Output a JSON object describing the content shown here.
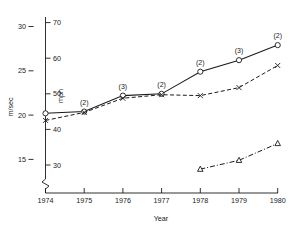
{
  "chart_data": {
    "type": "line",
    "title": "",
    "xlabel": "Year",
    "ylabel": "m/sec",
    "ylabel_secondary": "mph",
    "grid": false,
    "legend": "none",
    "axis_break": true,
    "x": [
      1974,
      1975,
      1976,
      1977,
      1978,
      1979,
      1980
    ],
    "xtick_labels": [
      "1974",
      "1975",
      "1976",
      "1977",
      "1978",
      "1979",
      "1980"
    ],
    "ylim": [
      13,
      30.8
    ],
    "ytick_labels": [
      "30",
      "25",
      "20",
      "15"
    ],
    "ytick_values": [
      30,
      25,
      20,
      15
    ],
    "ylim_secondary": [
      29.1,
      68.9
    ],
    "ytick_labels_secondary": [
      "70",
      "60",
      "50",
      "40",
      "30"
    ],
    "ytick_values_secondary": [
      70,
      60,
      50,
      40,
      30
    ],
    "series": [
      {
        "name": "circle-series",
        "marker": "circle",
        "linestyle": "solid",
        "x": [
          1974,
          1975,
          1976,
          1977,
          1978,
          1979,
          1980
        ],
        "values": [
          20.2,
          20.4,
          22.2,
          22.4,
          24.9,
          26.2,
          27.9
        ],
        "annotations": [
          "",
          "(2)",
          "(3)",
          "(2)",
          "(2)",
          "(3)",
          "(2)"
        ]
      },
      {
        "name": "cross-series",
        "marker": "x",
        "linestyle": "dashed",
        "x": [
          1974,
          1975,
          1976,
          1977,
          1978,
          1979,
          1980
        ],
        "values": [
          19.4,
          20.3,
          21.9,
          22.3,
          22.2,
          23.1,
          25.6
        ],
        "annotations": [
          "",
          "",
          "",
          "",
          "",
          "",
          ""
        ]
      },
      {
        "name": "triangle-series",
        "marker": "triangle",
        "linestyle": "dashdot",
        "x": [
          1978,
          1979,
          1980
        ],
        "values": [
          13.9,
          14.9,
          16.8
        ],
        "annotations": [
          "",
          "",
          ""
        ]
      }
    ]
  },
  "colors": {
    "ink": "#1a1a1a",
    "background": "#ffffff"
  }
}
